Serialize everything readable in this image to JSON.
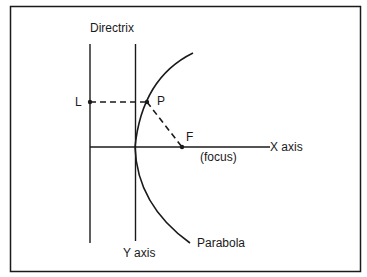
{
  "diagram": {
    "labels": {
      "directrix": "Directrix",
      "point_l": "L",
      "point_p": "P",
      "point_f": "F",
      "focus": "(focus)",
      "x_axis": "X axis",
      "y_axis": "Y axis",
      "parabola": "Parabola"
    },
    "colors": {
      "stroke": "#1a1a1a",
      "background": "#ffffff"
    },
    "points": {
      "L": [
        90,
        102
      ],
      "P": [
        147,
        102
      ],
      "F": [
        182,
        147
      ],
      "vertex": [
        135,
        147
      ]
    }
  }
}
